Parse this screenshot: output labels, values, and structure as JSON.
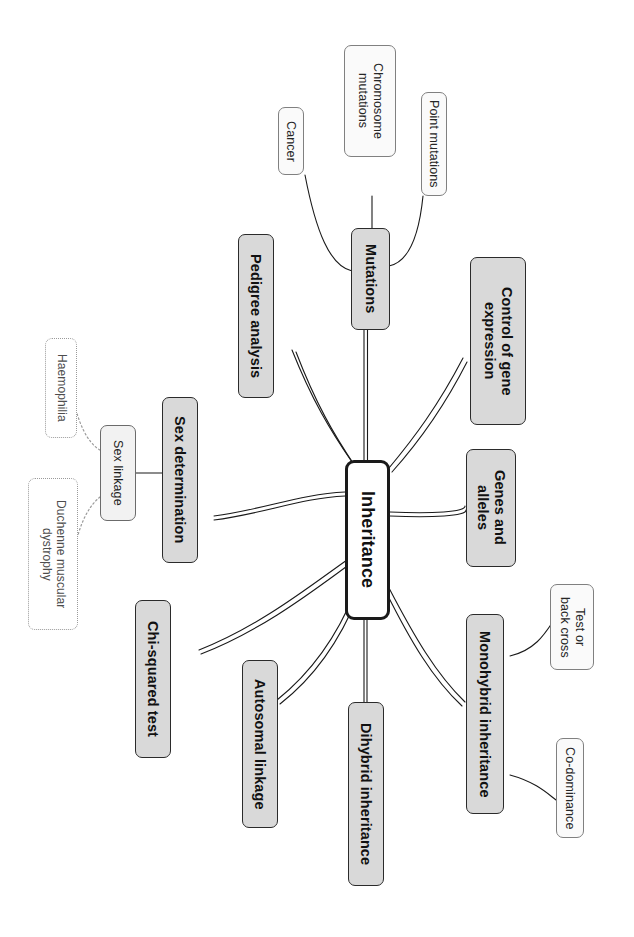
{
  "diagram": {
    "type": "mind-map",
    "title": "Inheritance",
    "orientation": "rotated-90-clockwise",
    "root": {
      "id": "inheritance",
      "label": "Inheritance",
      "style": "root"
    },
    "branches": [
      {
        "id": "mutations",
        "label": "Mutations",
        "style": "main",
        "children": [
          {
            "id": "chromosome-mutations",
            "label": "Chromosome\nmutations",
            "style": "leaf"
          },
          {
            "id": "point-mutations",
            "label": "Point mutations",
            "style": "leaf"
          },
          {
            "id": "cancer",
            "label": "Cancer",
            "style": "leaf"
          }
        ]
      },
      {
        "id": "pedigree-analysis",
        "label": "Pedigree analysis",
        "style": "main",
        "children": []
      },
      {
        "id": "control-of-gene-expression",
        "label": "Control of gene\nexpression",
        "style": "main",
        "children": []
      },
      {
        "id": "sex-determination",
        "label": "Sex determination",
        "style": "main",
        "children": [
          {
            "id": "sex-linkage",
            "label": "Sex linkage",
            "style": "leaf-lite",
            "children": [
              {
                "id": "haemophilia",
                "label": "Haemophilia",
                "style": "dotted"
              },
              {
                "id": "duchenne-muscular-dystrophy",
                "label": "Duchenne muscular\ndystrophy",
                "style": "dotted"
              }
            ]
          }
        ]
      },
      {
        "id": "genes-and-alleles",
        "label": "Genes and\nalleles",
        "style": "main",
        "children": []
      },
      {
        "id": "chi-squared-test",
        "label": "Chi-squared test",
        "style": "main",
        "children": []
      },
      {
        "id": "autosomal-linkage",
        "label": "Autosomal linkage",
        "style": "main",
        "children": []
      },
      {
        "id": "dihybrid-inheritance",
        "label": "Dihybrid inheritance",
        "style": "main",
        "children": []
      },
      {
        "id": "monohybrid-inheritance",
        "label": "Monohybrid inheritance",
        "style": "main",
        "children": [
          {
            "id": "test-or-back-cross",
            "label": "Test or\nback cross",
            "style": "leaf"
          },
          {
            "id": "co-dominance",
            "label": "Co-dominance",
            "style": "leaf"
          }
        ]
      }
    ],
    "colors": {
      "canvas_background": "#ffffff",
      "main_fill": "#d9d9d9",
      "main_stroke": "#2b2b2b",
      "leaf_fill": "#fafafa",
      "leaf_stroke": "#808080",
      "root_stroke": "#1a1a1a",
      "root_fill": "#ffffff",
      "dotted_stroke": "#9a9a9a",
      "connector": "#1a1a1a",
      "text": "#111111"
    }
  }
}
